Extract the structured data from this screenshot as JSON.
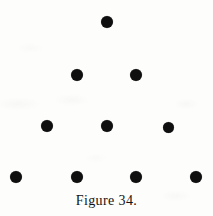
{
  "figure": {
    "caption": "Figure 34.",
    "caption_x": 106,
    "caption_y": 193,
    "background_color": "#fdfdfc",
    "dot_color": "#100f0f",
    "canvas": {
      "width": 213,
      "height": 216
    }
  },
  "chart_data": {
    "type": "scatter",
    "title": "Figure 34.",
    "xlabel": "",
    "ylabel": "",
    "xlim": [
      0,
      213
    ],
    "ylim": [
      0,
      216
    ],
    "grid": false,
    "legend": null,
    "rows": [
      {
        "row": 1,
        "count": 1,
        "y": 22,
        "x": [
          107
        ]
      },
      {
        "row": 2,
        "count": 2,
        "y": 75,
        "x": [
          77,
          136
        ]
      },
      {
        "row": 3,
        "count": 3,
        "y": 126,
        "x": [
          47,
          107,
          168
        ]
      },
      {
        "row": 4,
        "count": 4,
        "y": 177,
        "x": [
          16,
          77,
          136,
          196
        ]
      }
    ],
    "points": [
      {
        "id": "dot-1",
        "x": 107,
        "y": 22,
        "d": 12
      },
      {
        "id": "dot-2",
        "x": 77,
        "y": 75,
        "d": 12
      },
      {
        "id": "dot-3",
        "x": 136,
        "y": 75,
        "d": 12
      },
      {
        "id": "dot-4",
        "x": 47,
        "y": 126,
        "d": 12
      },
      {
        "id": "dot-5",
        "x": 107,
        "y": 126,
        "d": 12
      },
      {
        "id": "dot-6",
        "x": 168,
        "y": 127,
        "d": 11
      },
      {
        "id": "dot-7",
        "x": 16,
        "y": 177,
        "d": 12
      },
      {
        "id": "dot-8",
        "x": 77,
        "y": 177,
        "d": 12
      },
      {
        "id": "dot-9",
        "x": 136,
        "y": 177,
        "d": 12
      },
      {
        "id": "dot-10",
        "x": 196,
        "y": 177,
        "d": 12
      }
    ]
  }
}
